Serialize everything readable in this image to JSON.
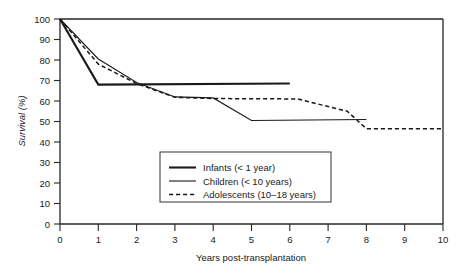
{
  "chart_data": {
    "type": "line",
    "title": "",
    "xlabel": "Years post-transplantation",
    "ylabel": "Survival (%)",
    "xlim": [
      0,
      10
    ],
    "ylim": [
      0,
      100
    ],
    "grid": false,
    "legend_position": "center",
    "xticks": [
      "0",
      "1",
      "2",
      "3",
      "4",
      "5",
      "6",
      "7",
      "8",
      "9",
      "10"
    ],
    "yticks": [
      "0",
      "10",
      "20",
      "30",
      "40",
      "50",
      "60",
      "70",
      "80",
      "90",
      "100"
    ],
    "series": [
      {
        "name": "Infants (< 1 year)",
        "style": "solid-thick",
        "x": [
          0,
          1,
          6
        ],
        "values": [
          100,
          68,
          68.5
        ]
      },
      {
        "name": "Children (< 10 years)",
        "style": "solid-thin",
        "x": [
          0,
          1,
          2,
          3,
          4,
          5,
          8
        ],
        "values": [
          100,
          80.5,
          69,
          62,
          61.5,
          50.5,
          51
        ]
      },
      {
        "name": "Adolescents (10–18 years)",
        "style": "dashed",
        "x": [
          0,
          1,
          2,
          3,
          4,
          6.2,
          7.5,
          8,
          10
        ],
        "values": [
          100,
          78,
          68.5,
          61.8,
          61.2,
          61,
          55,
          46.5,
          46.5
        ]
      }
    ],
    "legend": [
      {
        "label": "Infants (< 1 year)",
        "style": "solid-thick"
      },
      {
        "label": "Children (< 10 years)",
        "style": "solid-thin"
      },
      {
        "label": "Adolescents (10–18 years)",
        "style": "dashed"
      }
    ],
    "colors": {
      "line": "#1a1a1a",
      "axis": "#262626",
      "background": "#ffffff"
    }
  }
}
